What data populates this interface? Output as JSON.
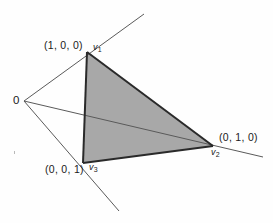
{
  "figure": {
    "background_color": "#fefefe",
    "labels": {
      "origin": "0",
      "vertex1_coord": "(1, 0, 0)",
      "vertex1_name": "v",
      "vertex1_sub": "1",
      "vertex2_coord": "(0, 1, 0)",
      "vertex2_name": "v",
      "vertex2_sub": "2",
      "vertex3_coord": "(0, 0, 1)",
      "vertex3_name": "v",
      "vertex3_sub": "3"
    },
    "colors": {
      "fill": "#a8a8a8",
      "edge": "#2a2a2a",
      "ray": "#5a5a5a",
      "text": "#1a1a1a"
    },
    "geometry": {
      "origin": [
        24,
        101
      ],
      "v1": [
        87,
        52
      ],
      "v2": [
        213,
        146
      ],
      "v3": [
        83,
        163
      ],
      "ray1_end": [
        144,
        14
      ],
      "ray2_end": [
        263,
        157
      ],
      "ray3_end": [
        119,
        211
      ]
    }
  }
}
